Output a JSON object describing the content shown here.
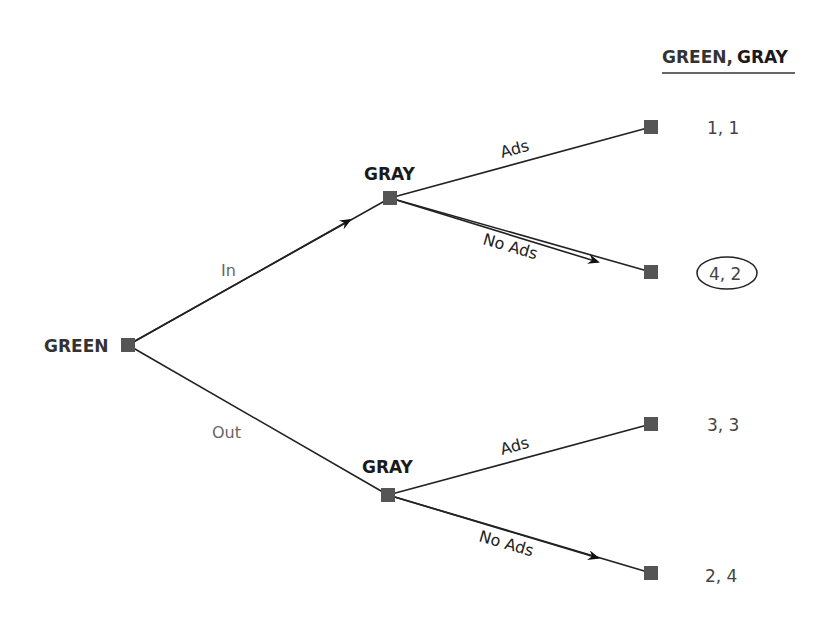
{
  "header": {
    "player1": "GREEN,",
    "player2": "GRAY"
  },
  "players": {
    "root": "GREEN",
    "upper": "GRAY",
    "lower": "GRAY"
  },
  "edges": {
    "in": "In",
    "out": "Out",
    "upper_ads": "Ads",
    "upper_no_ads": "No Ads",
    "lower_ads": "Ads",
    "lower_no_ads": "No Ads"
  },
  "payoffs": [
    {
      "label": "1, 1",
      "circled": false
    },
    {
      "label": "4, 2",
      "circled": true
    },
    {
      "label": "3, 3",
      "circled": false
    },
    {
      "label": "2, 4",
      "circled": false
    }
  ],
  "colors": {
    "node": "#555555",
    "edge": "#222222",
    "text": "#333333"
  }
}
